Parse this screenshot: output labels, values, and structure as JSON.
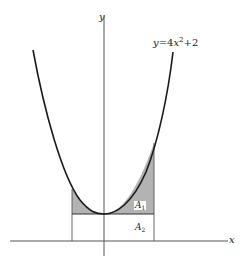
{
  "diagram": {
    "equation": {
      "lhs": "y",
      "eq": "=",
      "coef": "4",
      "var": "x",
      "exp": "2",
      "plus": "+",
      "const": "2"
    },
    "axes": {
      "x_label": "x",
      "y_label": "y"
    },
    "regions": [
      {
        "name": "A",
        "sub": "1",
        "description": "shaded region between curve and horizontal line y=2"
      },
      {
        "name": "A",
        "sub": "2",
        "description": "rectangle between horizontal line y=2 and x-axis"
      }
    ],
    "colors": {
      "curve": "#1a1a1a",
      "axes": "#555555",
      "shade": "#b3b3b3",
      "background": "#ffffff"
    }
  }
}
